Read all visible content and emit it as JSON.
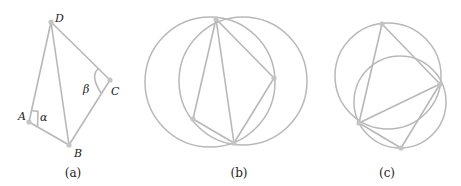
{
  "figure": {
    "panels": [
      {
        "id": "a",
        "caption": "(a)",
        "points": {
          "A": {
            "label": "A",
            "x": 29,
            "y": 122
          },
          "B": {
            "label": "B",
            "x": 69,
            "y": 145
          },
          "C": {
            "label": "C",
            "x": 110,
            "y": 80
          },
          "D": {
            "label": "D",
            "x": 51,
            "y": 22
          }
        },
        "angles": {
          "alpha": {
            "label": "α",
            "at": "A"
          },
          "beta": {
            "label": "β",
            "at": "C"
          }
        }
      },
      {
        "id": "b",
        "caption": "(b)"
      },
      {
        "id": "c",
        "caption": "(c)"
      }
    ],
    "colors": {
      "stroke": "#b8b8b8",
      "point": "#c4c4c4",
      "text": "#222222"
    }
  }
}
